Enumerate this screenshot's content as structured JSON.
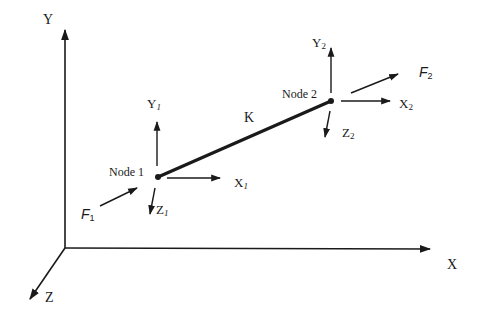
{
  "diagram": {
    "type": "3D beam element with two nodes in global coordinate system",
    "global_axes": {
      "x": "X",
      "y": "Y",
      "z": "Z"
    },
    "element": {
      "stiffness_label": "K"
    },
    "node1": {
      "label": "Node 1",
      "axes": {
        "x": "X",
        "x_sub": "1",
        "y": "Y",
        "y_sub": "1",
        "z": "Z",
        "z_sub": "1"
      },
      "force": {
        "symbol": "F",
        "sub": "1"
      }
    },
    "node2": {
      "label": "Node 2",
      "axes": {
        "x": "X",
        "x_sub": "2",
        "y": "Y",
        "y_sub": "2",
        "z": "Z",
        "z_sub": "2"
      },
      "force": {
        "symbol": "F",
        "sub": "2"
      }
    },
    "colors": {
      "ink": "#1a1a1a",
      "background": "#ffffff"
    }
  }
}
